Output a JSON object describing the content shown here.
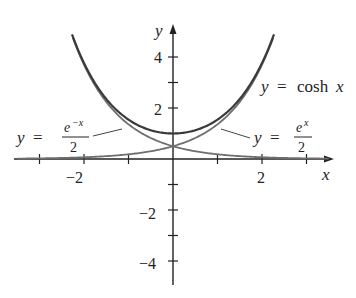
{
  "chart_data": {
    "type": "line",
    "title": "",
    "xlabel": "x",
    "ylabel": "y",
    "xlim": [
      -3.5,
      3.6
    ],
    "ylim": [
      -5,
      5.3
    ],
    "x_ticks": [
      -3,
      -2,
      -1,
      1,
      2,
      3
    ],
    "x_tick_labels": [
      {
        "value": -2,
        "label": "−2"
      },
      {
        "value": 2,
        "label": "2"
      }
    ],
    "y_ticks": [
      -4,
      -3,
      -2,
      -1,
      1,
      2,
      3,
      4
    ],
    "y_tick_labels": [
      {
        "value": 4,
        "label": "4"
      },
      {
        "value": 2,
        "label": "2"
      },
      {
        "value": -2,
        "label": "−2"
      },
      {
        "value": -4,
        "label": "−4"
      }
    ],
    "grid": false,
    "series": [
      {
        "name": "y = cosh x",
        "function": "cosh",
        "x_range": [
          -2.27,
          2.27
        ]
      },
      {
        "name": "y = e^x / 2",
        "function": "exp_half",
        "x_range": [
          -3.5,
          2.25
        ]
      },
      {
        "name": "y = e^-x / 2",
        "function": "expneg_half",
        "x_range": [
          -2.25,
          3.5
        ]
      }
    ],
    "annotations": [
      {
        "text": "y = cosh x",
        "near": [
          2.2,
          3.9
        ]
      },
      {
        "text": "y = e^x / 2",
        "near": [
          2.0,
          1.0
        ]
      },
      {
        "text": "y = e^-x / 2",
        "near": [
          -2.5,
          1.0
        ]
      }
    ]
  },
  "labels": {
    "x_axis": "x",
    "y_axis": "y",
    "tick_4": "4",
    "tick_2": "2",
    "tick_neg2_y": "−2",
    "tick_neg4_y": "−4",
    "tick_neg2_x": "−2",
    "tick_2_x": "2",
    "cosh_y": "y",
    "cosh_eq": "=",
    "cosh_fn": "cosh",
    "cosh_x": "x",
    "exp_y": "y",
    "exp_eq": "=",
    "exp_num_base": "e",
    "exp_num_sup": "x",
    "exp_den": "2",
    "expneg_y": "y",
    "expneg_eq": "=",
    "expneg_num_base": "e",
    "expneg_num_sup": "−x",
    "expneg_den": "2"
  },
  "colors": {
    "cosh": "#3a3a3a",
    "exp": "#6e6e6e",
    "axis": "#222222"
  }
}
